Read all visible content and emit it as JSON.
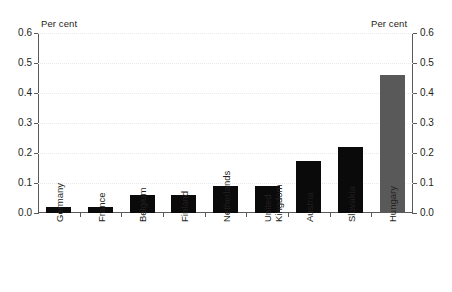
{
  "chart_data": {
    "type": "bar",
    "title": "",
    "subtitle": "",
    "xlabel": "",
    "ylabel": "Per cent",
    "ylabel_right": "Per cent",
    "ylim": [
      0,
      0.6
    ],
    "ytick_step": 0.1,
    "grid": true,
    "legend": "none",
    "categories": [
      "Germany",
      "France",
      "Belgium",
      "Finland",
      "Netherlands",
      "United\nKingdom",
      "Austria",
      "Slovakia",
      "Hungary"
    ],
    "values": [
      0.02,
      0.02,
      0.06,
      0.06,
      0.09,
      0.09,
      0.175,
      0.22,
      0.46
    ],
    "bar_colors": [
      "#0a0a0a",
      "#0a0a0a",
      "#0a0a0a",
      "#0a0a0a",
      "#0a0a0a",
      "#0a0a0a",
      "#0a0a0a",
      "#0a0a0a",
      "#595959"
    ],
    "ytick_labels": [
      "0.0",
      "0.1",
      "0.2",
      "0.3",
      "0.4",
      "0.5",
      "0.6"
    ],
    "ytick_values": [
      0.0,
      0.1,
      0.2,
      0.3,
      0.4,
      0.5,
      0.6
    ]
  },
  "axes": {
    "left_unit": "Per cent",
    "right_unit": "Per cent"
  },
  "colors": {
    "bar_primary": "#0a0a0a",
    "bar_highlight": "#595959",
    "axis": "#5a5a5a",
    "grid": "#e9e9ec",
    "background": "#ffffff",
    "text": "#231f20"
  }
}
